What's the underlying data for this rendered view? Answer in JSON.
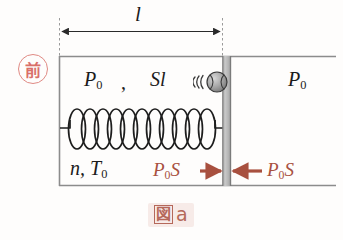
{
  "figure": {
    "caption_cjk": "図",
    "caption_latin": "a",
    "stamp": "前",
    "stamp_color": "#d9706a",
    "accent_color": "#a8503f",
    "caption_color": "#b5685a",
    "ink_color": "#1b1b1b",
    "piston_color": "#b0b0b0",
    "wall_color": "#8c8c8c"
  },
  "dimension": {
    "label": "l",
    "name": "length-of-gas-column"
  },
  "gas": {
    "pressure_label": "P",
    "pressure_sub": "0",
    "separator": ",",
    "volume_label": "Sl",
    "moles_temp_label": "n, T",
    "moles_temp_sub": "0"
  },
  "outside": {
    "pressure_label": "P",
    "pressure_sub": "0"
  },
  "forces": {
    "left": {
      "label": "P",
      "sub": "0",
      "tail": "S",
      "direction": "right"
    },
    "right": {
      "label": "P",
      "sub": "0",
      "tail": "S",
      "direction": "left"
    }
  },
  "icons": {
    "ball": "ball-icon",
    "spring": "spring-icon",
    "piston": "piston-icon",
    "arrow_left": "arrow-left-icon",
    "arrow_right": "arrow-right-icon"
  },
  "spring": {
    "coils": 11
  }
}
